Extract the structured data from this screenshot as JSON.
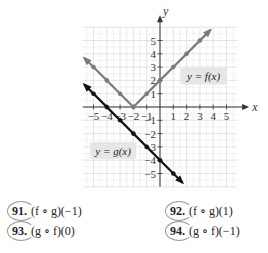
{
  "chart_data": {
    "type": "line",
    "title": "",
    "xlabel": "x",
    "ylabel": "y",
    "xlim": [
      -5.8,
      5.8
    ],
    "ylim": [
      -6,
      6
    ],
    "grid": true,
    "xticks": [
      -5,
      -4,
      -3,
      -2,
      -1,
      1,
      2,
      3,
      4,
      5
    ],
    "yticks": [
      -5,
      -4,
      -3,
      -2,
      -1,
      1,
      2,
      3,
      4,
      5
    ],
    "xtick_labels": [
      "−5",
      "−4",
      "−3",
      "−2",
      "−1",
      "1",
      "2",
      "3",
      "4",
      "5"
    ],
    "ytick_labels": [
      "−5",
      "−4",
      "−3",
      "−2",
      "−1",
      "1",
      "2",
      "3",
      "4",
      "5"
    ],
    "series": [
      {
        "name": "y = f(x)",
        "color": "#7a7a7a",
        "x": [
          -5.7,
          -2,
          3.8
        ],
        "y": [
          3.7,
          0,
          5.8
        ],
        "points": [
          [
            -5,
            3
          ],
          [
            -4,
            2
          ],
          [
            -3,
            1
          ],
          [
            -2,
            0
          ],
          [
            -1,
            1
          ],
          [
            0,
            2
          ],
          [
            1,
            3
          ],
          [
            2,
            4
          ],
          [
            3,
            5
          ]
        ]
      },
      {
        "name": "y = g(x)",
        "color": "#111111",
        "x": [
          -5.7,
          1.7
        ],
        "y": [
          1.7,
          -5.7
        ],
        "points": [
          [
            -5,
            1
          ],
          [
            -4,
            0
          ],
          [
            -3,
            -1
          ],
          [
            -2,
            -2
          ],
          [
            -1,
            -3
          ],
          [
            0,
            -4
          ],
          [
            1,
            -5
          ]
        ]
      }
    ],
    "annotations": [
      {
        "text": "y = f(x)",
        "series": "f",
        "anchor": [
          3.2,
          2.3
        ]
      },
      {
        "text": "y = g(x)",
        "series": "g",
        "anchor": [
          -3.6,
          -3.3
        ]
      }
    ]
  },
  "problems": [
    {
      "number": "91.",
      "expression": "(f ∘ g)(−1)"
    },
    {
      "number": "92.",
      "expression": "(f ∘ g)(1)"
    },
    {
      "number": "93.",
      "expression": "(g ∘ f)(0)"
    },
    {
      "number": "94.",
      "expression": "(g ∘ f)(−1)"
    }
  ]
}
